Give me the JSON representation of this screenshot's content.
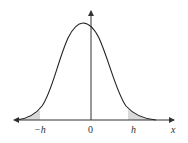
{
  "diagram": {
    "type": "bell-curve-with-tails",
    "labels": {
      "neg_h": "−h",
      "zero": "0",
      "h": "h",
      "x_axis": "x"
    },
    "colors": {
      "curve": "#222222",
      "axis": "#333333",
      "tail_fill": "#d9d9d9"
    }
  }
}
